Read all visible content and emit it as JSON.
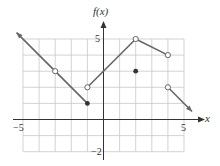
{
  "chart_data": {
    "type": "line",
    "title": "",
    "xlabel": "x",
    "ylabel": "f(x)",
    "xlim": [
      -5,
      5
    ],
    "ylim": [
      -2,
      5
    ],
    "grid": true,
    "x_tick_labels": [
      "-5",
      "5"
    ],
    "y_tick_labels": [
      "5",
      "-2"
    ],
    "segments": [
      {
        "from": [
          -5.4,
          5.4
        ],
        "to": [
          -1,
          1
        ],
        "start": "arrow",
        "end": "closed"
      },
      {
        "from": [
          -1,
          2
        ],
        "to": [
          2,
          5
        ],
        "start": "open",
        "end": "open"
      },
      {
        "from": [
          2,
          5
        ],
        "to": [
          4,
          4
        ],
        "start": "open",
        "end": "open"
      },
      {
        "from": [
          4,
          2
        ],
        "to": [
          5.5,
          0.5
        ],
        "start": "open",
        "end": "arrow"
      }
    ],
    "open_points": [
      [
        -3,
        3
      ],
      [
        -1,
        2
      ],
      [
        2,
        5
      ],
      [
        4,
        4
      ],
      [
        4,
        2
      ]
    ],
    "closed_points": [
      [
        -1,
        1
      ],
      [
        2,
        3
      ]
    ]
  },
  "axes": {
    "x_label": "x",
    "y_label": "f(x)",
    "x_min_label": "−5",
    "x_max_label": "5",
    "y_max_label": "5",
    "y_min_label": "−2"
  },
  "colors": {
    "grid": "#c8c8c8",
    "axis": "#333333",
    "curve": "#666666",
    "dot": "#333333"
  }
}
